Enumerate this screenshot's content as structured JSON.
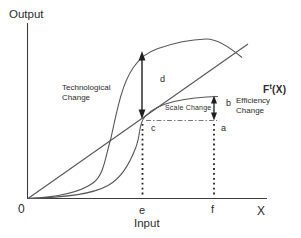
{
  "diagram": {
    "y_axis_label": "Output",
    "x_axis_label": "Input",
    "x_axis_symbol": "X",
    "origin_label": "0",
    "ticks": {
      "e": "e",
      "f": "f"
    },
    "annotations": {
      "technological_change": "Technological\nChange",
      "scale_change": "Scale Change",
      "efficiency_change": "Efficiency\nChange",
      "frontier": {
        "base": "F",
        "sup": "t",
        "args": "(X)"
      }
    },
    "segments": {
      "a": "a",
      "b": "b",
      "c": "c",
      "d": "d"
    },
    "colors": {
      "background": "#ffffff",
      "line": "#4f4f4f",
      "arrow": "#1f1f1f",
      "text": "#2b2b2b"
    },
    "curve_names": [
      "technological-frontier-curve",
      "current-frontier-curve",
      "origin-tangent-ray"
    ]
  }
}
